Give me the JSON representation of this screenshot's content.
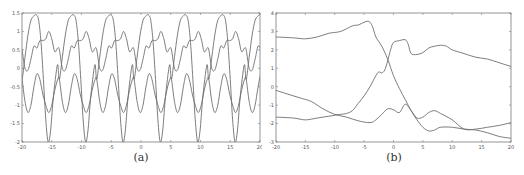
{
  "figure": {
    "panels": [
      {
        "id": "a",
        "caption": "(a)"
      },
      {
        "id": "b",
        "caption": "(b)"
      }
    ],
    "line_color": "#6e6e6e",
    "axis_color": "#7a7a7a"
  },
  "chart_data": [
    {
      "type": "line",
      "panel": "(a)",
      "title": "",
      "caption": "(a)",
      "xlabel": "",
      "ylabel": "",
      "xlim": [
        -20,
        20
      ],
      "ylim": [
        -2,
        1.5
      ],
      "xticks": [
        -20,
        -15,
        -10,
        -5,
        0,
        5,
        10,
        15,
        20
      ],
      "yticks": [
        -2,
        -1.5,
        -1,
        -0.5,
        0,
        0.5,
        1,
        1.5
      ],
      "xtick_labels": [
        "-20",
        "-15",
        "-10",
        "-5",
        "0",
        "5",
        "10",
        "15",
        "20"
      ],
      "ytick_labels": [
        "-2",
        "-1.5",
        "-1",
        "-0.5",
        "0",
        "0.5",
        "1",
        "1.5"
      ],
      "grid": false,
      "legend": null,
      "period_approx": 6.28,
      "series": [
        {
          "name": "curve-1",
          "description": "large-amplitude periodic wave, peaks ~1.45 near x=-17.6,-11.3,-5,1.3,7.6,13.9,20; minima ~-2 near x=-15.5,-9.2,-3,3.3,9.5,15.8",
          "x": [
            -20,
            -19.5,
            -19,
            -18.5,
            -18,
            -17.6,
            -17.2,
            -16.8,
            -16.4,
            -16,
            -15.6,
            -15.2,
            -14.8,
            -14.4,
            -14,
            -13.6,
            -13.3,
            -13,
            -12.6,
            -12.2,
            -11.8,
            -11.3
          ],
          "y": [
            -0.3,
            0.3,
            0.9,
            1.3,
            1.42,
            1.45,
            1.3,
            0.7,
            -0.3,
            -1.4,
            -2.0,
            -1.7,
            -0.9,
            -0.3,
            0.1,
            0.5,
            0.55,
            0.2,
            -0.35,
            0.2,
            0.9,
            1.45
          ]
        },
        {
          "name": "curve-2",
          "description": "mid-level periodic wave, range ~-0.1 to 1.0 with double bumps",
          "x": [
            -20,
            -19.5,
            -19,
            -18.5,
            -18,
            -17.5,
            -17,
            -16.5,
            -16,
            -15.5,
            -15,
            -14.5,
            -14,
            -13.5,
            -13,
            -12.5,
            -12,
            -11.5,
            -11,
            -10.5,
            -10,
            -9.5
          ],
          "y": [
            0.5,
            0.0,
            -0.05,
            0.25,
            0.6,
            0.55,
            0.75,
            0.75,
            0.8,
            1.0,
            0.8,
            0.45,
            0.55,
            0.2,
            -0.05,
            0.2,
            0.6,
            0.55,
            0.75,
            0.75,
            0.85,
            1.0
          ]
        },
        {
          "name": "curve-3",
          "description": "lower periodic wave, range ~-1.2 to -0.15",
          "x": [
            -20,
            -19.5,
            -19,
            -18.5,
            -18,
            -17.5,
            -17,
            -16.5,
            -16,
            -15.5,
            -15,
            -14.5,
            -14,
            -13.5,
            -13,
            -12.5,
            -12,
            -11.5,
            -11,
            -10.5,
            -10,
            -9.5
          ],
          "y": [
            -0.3,
            -0.9,
            -1.2,
            -1.0,
            -0.5,
            -0.15,
            -0.3,
            -0.7,
            -1.0,
            -1.2,
            -1.0,
            -0.6,
            -0.3,
            -0.2,
            -0.6,
            -1.1,
            -1.2,
            -0.8,
            -0.35,
            -0.15,
            -0.4,
            -0.9
          ]
        }
      ]
    },
    {
      "type": "line",
      "panel": "(b)",
      "title": "",
      "caption": "(b)",
      "xlabel": "",
      "ylabel": "",
      "xlim": [
        -20,
        20
      ],
      "ylim": [
        -3,
        4
      ],
      "xticks": [
        -20,
        -15,
        -10,
        -5,
        0,
        5,
        10,
        15,
        20
      ],
      "yticks": [
        -3,
        -2,
        -1,
        0,
        1,
        2,
        3,
        4
      ],
      "xtick_labels": [
        "-20",
        "-15",
        "-10",
        "-5",
        "0",
        "5",
        "10",
        "15",
        "20"
      ],
      "ytick_labels": [
        "-3",
        "-2",
        "-1",
        "0",
        "1",
        "2",
        "3",
        "4"
      ],
      "grid": false,
      "legend": null,
      "series": [
        {
          "name": "curve-top-falling",
          "x": [
            -20,
            -17,
            -15,
            -13,
            -11,
            -9,
            -7,
            -6,
            -5,
            -4.5,
            -4,
            -3.5,
            -3,
            -2,
            -1,
            0,
            1,
            2,
            3,
            4,
            5,
            6,
            7,
            8,
            10,
            12,
            14,
            16,
            18,
            20
          ],
          "y": [
            2.7,
            2.65,
            2.6,
            2.7,
            2.9,
            3.0,
            3.3,
            3.35,
            3.5,
            3.55,
            3.5,
            3.2,
            2.7,
            2.2,
            1.5,
            0.6,
            -0.1,
            -0.7,
            -1.3,
            -1.8,
            -2.2,
            -2.4,
            -2.35,
            -2.2,
            -2.2,
            -2.3,
            -2.35,
            -2.5,
            -2.7,
            -2.8
          ]
        },
        {
          "name": "curve-rising",
          "x": [
            -20,
            -17,
            -15,
            -13,
            -11,
            -9,
            -8,
            -7,
            -6,
            -5,
            -4,
            -3,
            -2.5,
            -2,
            -1.5,
            -1,
            -0.5,
            0,
            1,
            2,
            2.5,
            3,
            4,
            5,
            6,
            7,
            8,
            9,
            10,
            12,
            14,
            16,
            18,
            20
          ],
          "y": [
            -1.65,
            -1.7,
            -1.8,
            -1.7,
            -1.6,
            -1.5,
            -1.45,
            -1.3,
            -0.9,
            -0.5,
            0.0,
            0.6,
            0.8,
            0.75,
            0.9,
            1.4,
            2.0,
            2.4,
            2.5,
            2.55,
            2.3,
            1.8,
            1.75,
            1.85,
            2.1,
            2.2,
            2.25,
            2.2,
            2.0,
            1.8,
            1.6,
            1.5,
            1.3,
            1.1
          ]
        },
        {
          "name": "curve-bottom",
          "x": [
            -20,
            -18,
            -16,
            -14,
            -12,
            -10,
            -8,
            -6,
            -4,
            -3,
            -2,
            -1,
            0,
            1,
            2,
            3,
            4,
            5,
            6,
            7,
            8,
            10,
            12,
            14,
            16,
            18,
            20
          ],
          "y": [
            -0.2,
            -0.4,
            -0.6,
            -0.8,
            -1.2,
            -1.5,
            -1.65,
            -1.85,
            -1.95,
            -1.8,
            -1.5,
            -1.2,
            -1.25,
            -1.4,
            -0.95,
            -1.3,
            -1.7,
            -1.65,
            -1.4,
            -1.3,
            -1.45,
            -1.8,
            -2.3,
            -2.3,
            -2.2,
            -2.1,
            -1.95
          ]
        }
      ]
    }
  ]
}
